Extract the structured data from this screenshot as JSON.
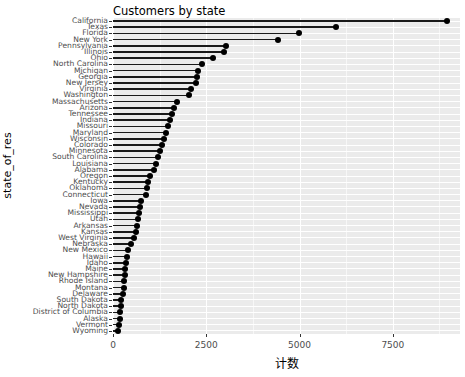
{
  "chart_data": {
    "type": "bar",
    "subtype": "lollipop-horizontal",
    "title": "Customers by state",
    "xlabel": "计数",
    "ylabel": "state_of_res",
    "xlim": [
      0,
      9300
    ],
    "ylim": null,
    "grid": true,
    "legend": null,
    "orientation": "horizontal",
    "x_ticks": [
      "0",
      "2500",
      "5000",
      "7500"
    ],
    "x_tick_values": [
      0,
      2500,
      5000,
      7500
    ],
    "categories": [
      "California",
      "Texas",
      "Florida",
      "New York",
      "Pennsylvania",
      "Illinois",
      "Ohio",
      "North Carolina",
      "Michigan",
      "Georgia",
      "New Jersey",
      "Virginia",
      "Washington",
      "Massachusetts",
      "Arizona",
      "Tennessee",
      "Indiana",
      "Missouri",
      "Maryland",
      "Wisconsin",
      "Colorado",
      "Minnesota",
      "South Carolina",
      "Louisiana",
      "Alabama",
      "Oregon",
      "Kentucky",
      "Oklahoma",
      "Connecticut",
      "Iowa",
      "Nevada",
      "Mississippi",
      "Utah",
      "Arkansas",
      "Kansas",
      "West Virginia",
      "Nebraska",
      "New Mexico",
      "Hawaii",
      "Idaho",
      "Maine",
      "New Hampshire",
      "Rhode Island",
      "Montana",
      "Delaware",
      "South Dakota",
      "North Dakota",
      "District of Columbia",
      "Alaska",
      "Vermont",
      "Wyoming"
    ],
    "values": [
      8950,
      5970,
      4985,
      4435,
      3040,
      2985,
      2685,
      2385,
      2270,
      2245,
      2215,
      2080,
      2025,
      1725,
      1640,
      1590,
      1530,
      1480,
      1425,
      1370,
      1315,
      1260,
      1205,
      1150,
      1095,
      985,
      930,
      905,
      875,
      740,
      715,
      690,
      660,
      630,
      605,
      550,
      470,
      415,
      385,
      355,
      330,
      320,
      300,
      295,
      275,
      220,
      205,
      190,
      175,
      160,
      140
    ]
  }
}
